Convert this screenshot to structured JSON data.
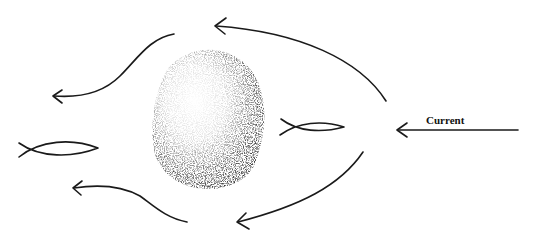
{
  "diagram": {
    "type": "flow-around-obstacle",
    "labels": {
      "current": "Current"
    },
    "elements": {
      "obstacle": "rock",
      "fish": [
        "fish-downstream",
        "fish-upstream-eddy"
      ],
      "flow_arrows": [
        "flow-arrow-top-right",
        "flow-arrow-bottom-right",
        "flow-arrow-top-left",
        "flow-arrow-bottom-left"
      ]
    },
    "colors": {
      "ink": "#1a1a1a",
      "background": "#ffffff"
    }
  }
}
